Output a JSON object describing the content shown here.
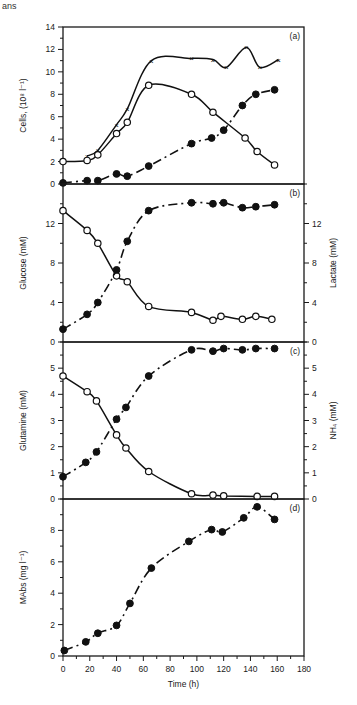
{
  "header_fragment": "ans",
  "chart_data": [
    {
      "panel": "a",
      "type": "line",
      "tag": "(a)",
      "ylabel": "Cells, (10⁸ l⁻¹)",
      "ylim": [
        0,
        14
      ],
      "yticks": [
        0,
        2,
        4,
        6,
        8,
        10,
        12,
        14
      ],
      "series": [
        {
          "name": "total-cells",
          "marker": "x",
          "curve": "solid",
          "x": [
            18,
            26,
            40,
            48,
            66,
            96,
            112,
            122,
            137,
            147,
            161
          ],
          "y": [
            2.5,
            3.0,
            5.3,
            6.7,
            11.0,
            11.2,
            11.1,
            10.4,
            12.2,
            10.4,
            11.1
          ]
        },
        {
          "name": "viable-cells",
          "marker": "open",
          "curve": "solid",
          "x": [
            0,
            18,
            26,
            40,
            48,
            64,
            96,
            112,
            136,
            145,
            158
          ],
          "y": [
            2.0,
            2.1,
            2.6,
            4.5,
            5.5,
            8.8,
            8.0,
            6.4,
            4.1,
            2.9,
            1.7
          ]
        },
        {
          "name": "dead-cells",
          "marker": "filled",
          "curve": "dashed",
          "x": [
            0,
            18,
            26,
            40,
            48,
            64,
            96,
            111,
            120,
            134,
            144,
            158
          ],
          "y": [
            0.1,
            0.3,
            0.3,
            0.9,
            0.7,
            1.6,
            3.6,
            4.1,
            4.8,
            7.0,
            8.0,
            8.4
          ]
        }
      ]
    },
    {
      "panel": "b",
      "type": "line",
      "tag": "(b)",
      "ylabel": "Glucose (mM)",
      "ylabel_right": "Lactate (mM)",
      "ylim": [
        0,
        16
      ],
      "yticks": [
        0,
        4,
        8,
        12
      ],
      "ylim_right": [
        0,
        16
      ],
      "yticks_right": [
        0,
        4,
        8,
        12
      ],
      "series": [
        {
          "name": "glucose",
          "axis": "left",
          "marker": "open",
          "curve": "solid",
          "x": [
            0,
            18,
            26,
            40,
            48,
            64,
            96,
            112,
            118,
            134,
            144,
            156
          ],
          "y": [
            13.3,
            11.3,
            10.0,
            6.7,
            6.1,
            3.6,
            3.0,
            2.2,
            2.6,
            2.3,
            2.6,
            2.3
          ]
        },
        {
          "name": "lactate",
          "axis": "right",
          "marker": "filled",
          "curve": "dashed",
          "x": [
            0,
            18,
            26,
            40,
            48,
            64,
            96,
            112,
            120,
            134,
            144,
            158
          ],
          "y": [
            1.3,
            2.8,
            4.0,
            7.3,
            10.2,
            13.3,
            14.1,
            14.0,
            14.1,
            13.6,
            13.7,
            13.9
          ]
        }
      ]
    },
    {
      "panel": "c",
      "type": "line",
      "tag": "(c)",
      "ylabel": "Glutamine (mM)",
      "ylabel_right": "NH₄ (mM)",
      "ylim": [
        0,
        6
      ],
      "yticks": [
        0,
        1,
        2,
        3,
        4,
        5
      ],
      "ylim_right": [
        0,
        6
      ],
      "yticks_right": [
        0,
        1,
        2,
        3,
        4,
        5
      ],
      "series": [
        {
          "name": "glutamine",
          "axis": "left",
          "marker": "open",
          "curve": "solid",
          "x": [
            0,
            18,
            25,
            40,
            47,
            64,
            96,
            112,
            120,
            145,
            158
          ],
          "y": [
            4.7,
            4.1,
            3.75,
            2.45,
            1.95,
            1.05,
            0.2,
            0.15,
            0.12,
            0.1,
            0.1
          ]
        },
        {
          "name": "ammonium",
          "axis": "right",
          "marker": "filled",
          "curve": "dashed",
          "x": [
            0,
            17,
            25,
            40,
            47,
            64,
            96,
            112,
            120,
            134,
            144,
            158
          ],
          "y": [
            0.85,
            1.4,
            1.8,
            3.05,
            3.5,
            4.7,
            5.7,
            5.65,
            5.75,
            5.7,
            5.75,
            5.75
          ]
        }
      ]
    },
    {
      "panel": "d",
      "type": "line",
      "tag": "(d)",
      "ylabel": "MAbs (mg l⁻¹)",
      "xlabel": "Time (h)",
      "xlim": [
        0,
        180
      ],
      "xticks": [
        0,
        20,
        40,
        60,
        80,
        100,
        120,
        140,
        160,
        180
      ],
      "ylim": [
        0,
        10
      ],
      "yticks": [
        0,
        2,
        4,
        6,
        8
      ],
      "series": [
        {
          "name": "mabs",
          "marker": "filled",
          "curve": "dashed",
          "x": [
            1,
            17,
            26,
            40,
            50,
            66,
            94,
            111,
            119,
            135,
            145,
            158
          ],
          "y": [
            0.35,
            0.9,
            1.45,
            1.95,
            3.35,
            5.6,
            7.3,
            8.05,
            7.9,
            8.8,
            9.5,
            8.7
          ]
        }
      ]
    }
  ]
}
